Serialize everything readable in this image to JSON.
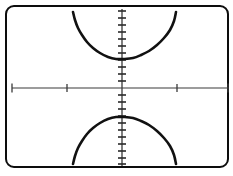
{
  "viewport": {
    "label": "graphing-calculator-screen",
    "width": 233,
    "height": 176,
    "frame_color": "#0d0d0d",
    "background_color": "#ffffff",
    "curve_color": "#111111",
    "axis_color": "#3a3a3a"
  },
  "chart_data": {
    "type": "line",
    "title": "",
    "subtitle": "",
    "xlabel": "",
    "ylabel": "",
    "grid": false,
    "legend": [],
    "legend_position": "none",
    "axes": {
      "x_axis_visible": true,
      "y_axis_visible": true,
      "origin_px": [
        122,
        88
      ],
      "xlim": [
        -10,
        10
      ],
      "ylim": [
        -10,
        10
      ],
      "x_tick_step": 5,
      "y_tick_step": 1,
      "x_tick_values": [
        -10,
        -5,
        5,
        10
      ],
      "y_tick_values": [
        -10,
        -9,
        -8,
        -7,
        -6,
        -5,
        -4,
        -3,
        -2,
        -1,
        1,
        2,
        3,
        4,
        5,
        6,
        7,
        8,
        9,
        10
      ],
      "x_tick_labels": [],
      "y_tick_labels": []
    },
    "curve_description": "hyperbola with vertical transverse axis, two branches opening upward and downward",
    "equation": "y^2/a^2 - x^2/b^2 = 1",
    "vertices": [
      [
        0,
        3
      ],
      [
        0,
        -3
      ]
    ],
    "series": [
      {
        "name": "upper-branch",
        "points_px": [
          [
            73,
            12
          ],
          [
            75,
            20
          ],
          [
            78,
            28
          ],
          [
            82,
            35
          ],
          [
            87,
            42
          ],
          [
            93,
            48
          ],
          [
            100,
            53
          ],
          [
            108,
            57
          ],
          [
            116,
            59
          ],
          [
            124,
            59
          ],
          [
            133,
            58
          ],
          [
            141,
            55
          ],
          [
            149,
            51
          ],
          [
            157,
            45
          ],
          [
            164,
            38
          ],
          [
            170,
            30
          ],
          [
            174,
            21
          ],
          [
            176,
            12
          ]
        ],
        "vertex_px": [
          122,
          59
        ]
      },
      {
        "name": "lower-branch",
        "points_px": [
          [
            73,
            164
          ],
          [
            75,
            156
          ],
          [
            78,
            148
          ],
          [
            82,
            141
          ],
          [
            87,
            134
          ],
          [
            93,
            128
          ],
          [
            100,
            123
          ],
          [
            108,
            119
          ],
          [
            116,
            117
          ],
          [
            124,
            117
          ],
          [
            133,
            118
          ],
          [
            141,
            121
          ],
          [
            149,
            125
          ],
          [
            157,
            131
          ],
          [
            164,
            138
          ],
          [
            170,
            146
          ],
          [
            174,
            155
          ],
          [
            176,
            164
          ]
        ],
        "vertex_px": [
          122,
          117
        ]
      }
    ]
  },
  "elements": {
    "frame_name": "graph-viewport-frame",
    "x_axis_name": "x-axis",
    "y_axis_name": "y-axis",
    "upper_curve_name": "upper-hyperbola-branch",
    "lower_curve_name": "lower-hyperbola-branch"
  }
}
